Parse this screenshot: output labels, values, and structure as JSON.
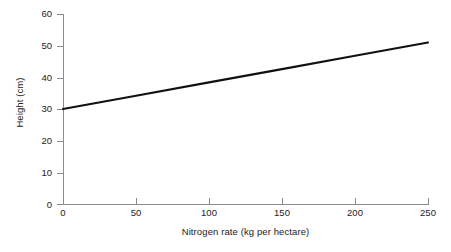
{
  "chart_data": {
    "type": "line",
    "title": "",
    "xlabel": "Nitrogen rate (kg per hectare)",
    "ylabel": "Height (cm)",
    "xlim": [
      0,
      250
    ],
    "ylim": [
      0,
      60
    ],
    "xticks": [
      0,
      50,
      100,
      150,
      200,
      250
    ],
    "yticks": [
      0,
      10,
      20,
      30,
      40,
      50,
      60
    ],
    "xtick_labels": [
      "0",
      "50",
      "100",
      "150",
      "200",
      "250"
    ],
    "ytick_labels": [
      "0",
      "10",
      "20",
      "30",
      "40",
      "50",
      "60"
    ],
    "grid": false,
    "legend": false,
    "series": [
      {
        "name": "Height vs nitrogen rate",
        "color": "#111111",
        "x": [
          0,
          50,
          100,
          150,
          200,
          250
        ],
        "values": [
          30.0,
          34.2,
          38.4,
          42.6,
          46.8,
          51.0
        ]
      }
    ],
    "annotations": []
  },
  "axis": {
    "y_title": "Height (cm)",
    "x_title": "Nitrogen rate (kg per hectare)",
    "axis_color": "#8a8a8a",
    "line_color": "#111111"
  }
}
